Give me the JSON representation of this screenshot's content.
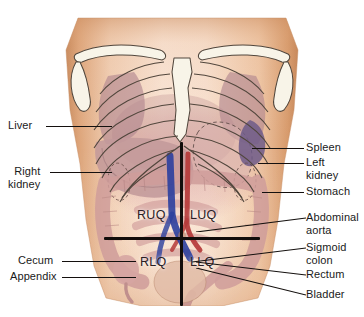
{
  "colors": {
    "background": "#ffffff",
    "skin_light": "#f6ddcb",
    "skin_mid": "#e8b995",
    "skin_edge": "#cf8f61",
    "skin_shadow": "#b9764a",
    "bone": "#f7f3e6",
    "bone_line": "#4a4038",
    "lung": "#b08a94",
    "liver": "#c09a9b",
    "intestine": "#d7a7a5",
    "spleen": "#6b5a86",
    "artery": "#b83a3a",
    "vein": "#2b3f9e",
    "label_text": "#1a1a1a",
    "leader_line": "#14100e",
    "cross_line": "#120d0b"
  },
  "labels_left": [
    {
      "id": "liver",
      "text": "Liver",
      "text2": "",
      "x": 8,
      "y": 119,
      "line_x": 46,
      "line_w": 66,
      "line_y": 126
    },
    {
      "id": "right-kidney",
      "text": "Right",
      "text2": "kidney",
      "x": 8,
      "y": 165,
      "line_x": 50,
      "line_w": 62,
      "line_y": 172
    },
    {
      "id": "cecum",
      "text": "Cecum",
      "text2": "",
      "x": 18,
      "y": 254,
      "line_x": 62,
      "line_w": 74,
      "line_y": 261
    },
    {
      "id": "appendix",
      "text": "Appendix",
      "text2": "",
      "x": 10,
      "y": 270,
      "line_x": 62,
      "line_w": 74,
      "line_y": 277
    }
  ],
  "labels_right": [
    {
      "id": "spleen",
      "text": "Spleen",
      "text2": "",
      "x": 306,
      "y": 141,
      "line_x": 288,
      "line_w": 16,
      "line_y": 148
    },
    {
      "id": "left-kidney",
      "text": "Left",
      "text2": "kidney",
      "x": 306,
      "y": 156,
      "line_x": 288,
      "line_w": 16,
      "line_y": 163
    },
    {
      "id": "stomach",
      "text": "Stomach",
      "text2": "",
      "x": 306,
      "y": 185,
      "line_x": 288,
      "line_w": 16,
      "line_y": 192
    },
    {
      "id": "abdominal-aorta",
      "text": "Abdominal",
      "text2": "aorta",
      "x": 306,
      "y": 211,
      "line_x": 288,
      "line_w": 16,
      "line_y": 218
    },
    {
      "id": "sigmoid-colon",
      "text": "Sigmoid",
      "text2": "colon",
      "x": 306,
      "y": 241,
      "line_x": 288,
      "line_w": 16,
      "line_y": 248
    },
    {
      "id": "rectum",
      "text": "Rectum",
      "text2": "",
      "x": 306,
      "y": 268,
      "line_x": 288,
      "line_w": 16,
      "line_y": 275
    },
    {
      "id": "bladder",
      "text": "Bladder",
      "text2": "",
      "x": 306,
      "y": 288,
      "line_x": 288,
      "line_w": 16,
      "line_y": 295
    }
  ],
  "quadrants": [
    {
      "id": "ruq",
      "text": "RUQ",
      "full": "right upper quadrant",
      "x": 137,
      "y": 208
    },
    {
      "id": "luq",
      "text": "LUQ",
      "full": "left upper quadrant",
      "x": 190,
      "y": 208
    },
    {
      "id": "rlq",
      "text": "RLQ",
      "full": "right lower quadrant",
      "x": 140,
      "y": 255
    },
    {
      "id": "llq",
      "text": "LLQ",
      "full": "left lower quadrant",
      "x": 190,
      "y": 255
    }
  ],
  "cross": {
    "vertical": {
      "x": 180,
      "y": 142,
      "h": 164
    },
    "horizontal": {
      "x": 104,
      "y": 237,
      "w": 156
    }
  }
}
